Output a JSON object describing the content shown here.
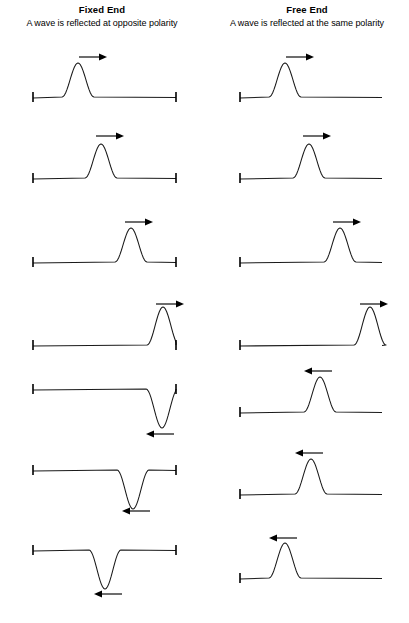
{
  "figure": {
    "title_left": "Fixed End",
    "subtitle_left": "A wave is reflected at opposite polarity",
    "title_right": "Free End",
    "subtitle_right": "A wave is reflected at the same polarity",
    "line_color": "#1a1a1a",
    "background": "#ffffff"
  },
  "chart_data": {
    "type": "line",
    "xlabel": "",
    "ylabel": "",
    "grid": false,
    "legend": null,
    "frame_count": 7,
    "columns": [
      {
        "name": "Fixed End",
        "boundary": "fixed",
        "boundary_marks": [
          "left-tick",
          "right-tick"
        ],
        "subtitle": "A wave is reflected at opposite polarity",
        "x_start": 33,
        "x_end": 176,
        "frames": [
          {
            "index": 1,
            "baseline_y": 97,
            "peak_x": 78,
            "amplitude": 34,
            "polarity": "up",
            "half_width": 16,
            "arrow": "right",
            "arrow_x": 93,
            "arrow_y": 57,
            "arrow_len": 28
          },
          {
            "index": 2,
            "baseline_y": 178,
            "peak_x": 101,
            "amplitude": 34,
            "polarity": "up",
            "half_width": 16,
            "arrow": "right",
            "arrow_x": 110,
            "arrow_y": 136,
            "arrow_len": 28
          },
          {
            "index": 3,
            "baseline_y": 262,
            "peak_x": 131,
            "amplitude": 34,
            "polarity": "up",
            "half_width": 16,
            "arrow": "right",
            "arrow_x": 139,
            "arrow_y": 222,
            "arrow_len": 28
          },
          {
            "index": 4,
            "baseline_y": 345,
            "peak_x": 163,
            "amplitude": 38,
            "polarity": "up",
            "half_width": 16,
            "arrow": "right",
            "arrow_x": 170,
            "arrow_y": 304,
            "arrow_len": 28
          },
          {
            "index": 5,
            "baseline_y": 389,
            "peak_x": 162,
            "amplitude": -39,
            "polarity": "down",
            "half_width": 16,
            "arrow": "left",
            "arrow_x": 160,
            "arrow_y": 434,
            "arrow_len": 28
          },
          {
            "index": 6,
            "baseline_y": 470,
            "peak_x": 133,
            "amplitude": -39,
            "polarity": "down",
            "half_width": 16,
            "arrow": "left",
            "arrow_x": 136,
            "arrow_y": 511,
            "arrow_len": 28
          },
          {
            "index": 7,
            "baseline_y": 550,
            "peak_x": 105,
            "amplitude": -39,
            "polarity": "down",
            "half_width": 16,
            "arrow": "left",
            "arrow_x": 108,
            "arrow_y": 594,
            "arrow_len": 28
          }
        ]
      },
      {
        "name": "Free End",
        "boundary": "free",
        "boundary_marks": [
          "left-tick"
        ],
        "subtitle": "A wave is reflected at the same polarity",
        "x_start": 240,
        "x_end": 382,
        "frames": [
          {
            "index": 1,
            "baseline_y": 97,
            "peak_x": 285,
            "amplitude": 34,
            "polarity": "up",
            "half_width": 16,
            "arrow": "right",
            "arrow_x": 300,
            "arrow_y": 57,
            "arrow_len": 28
          },
          {
            "index": 2,
            "baseline_y": 178,
            "peak_x": 309,
            "amplitude": 34,
            "polarity": "up",
            "half_width": 16,
            "arrow": "right",
            "arrow_x": 317,
            "arrow_y": 136,
            "arrow_len": 28
          },
          {
            "index": 3,
            "baseline_y": 262,
            "peak_x": 340,
            "amplitude": 34,
            "polarity": "up",
            "half_width": 16,
            "arrow": "right",
            "arrow_x": 347,
            "arrow_y": 222,
            "arrow_len": 28
          },
          {
            "index": 4,
            "baseline_y": 345,
            "peak_x": 370,
            "amplitude": 38,
            "polarity": "up",
            "half_width": 16,
            "arrow": "right",
            "arrow_x": 374,
            "arrow_y": 304,
            "arrow_len": 28
          },
          {
            "index": 5,
            "baseline_y": 412,
            "peak_x": 320,
            "amplitude": 35,
            "polarity": "up",
            "half_width": 16,
            "arrow": "left",
            "arrow_x": 318,
            "arrow_y": 371,
            "arrow_len": 28
          },
          {
            "index": 6,
            "baseline_y": 494,
            "peak_x": 311,
            "amplitude": 35,
            "polarity": "up",
            "half_width": 16,
            "arrow": "left",
            "arrow_x": 309,
            "arrow_y": 453,
            "arrow_len": 28
          },
          {
            "index": 7,
            "baseline_y": 578,
            "peak_x": 285,
            "amplitude": 35,
            "polarity": "up",
            "half_width": 16,
            "arrow": "left",
            "arrow_x": 283,
            "arrow_y": 538,
            "arrow_len": 28
          }
        ]
      }
    ]
  }
}
